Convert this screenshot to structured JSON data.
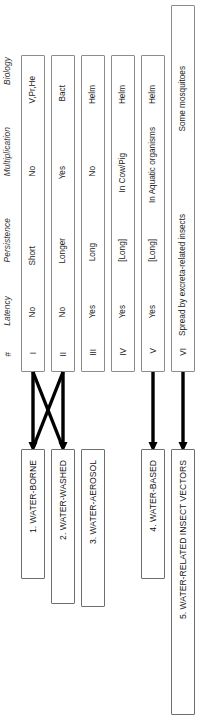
{
  "diagram": {
    "orientation": "rotated-90-ccw",
    "stroke_color": "#000000",
    "box_border_color": "#8c8c8c"
  },
  "columns": {
    "number_header": "#",
    "headers": [
      "Latency",
      "Persistence",
      "Multiplication",
      "Biology"
    ]
  },
  "rows": [
    {
      "numeral": "I",
      "latency": "No",
      "persistence": "Short",
      "multiplication": "No",
      "biology": "V,Pr,He"
    },
    {
      "numeral": "II",
      "latency": "No",
      "persistence": "Longer",
      "multiplication": "Yes",
      "biology": "Bact"
    },
    {
      "numeral": "III",
      "latency": "Yes",
      "persistence": "Long",
      "multiplication": "No",
      "biology": "Helm"
    },
    {
      "numeral": "IV",
      "latency": "Yes",
      "persistence": "[Long]",
      "multiplication": "In Cow/Pig",
      "biology": "Helm"
    },
    {
      "numeral": "V",
      "latency": "Yes",
      "persistence": "[Long]",
      "multiplication": "In Aquatic organisms",
      "biology": "Helm"
    },
    {
      "numeral": "VI",
      "note": "Spread by excreta-related insects",
      "biology": "Some mosquitoes"
    }
  ],
  "categories": [
    {
      "label": "1.  WATER-BORNE"
    },
    {
      "label": "2.  WATER-WASHED"
    },
    {
      "label": "3.  WATER-AEROSOL"
    },
    {
      "label": "4.  WATER-BASED"
    },
    {
      "label": "5.  WATER-RELATED INSECT VECTORS"
    }
  ]
}
